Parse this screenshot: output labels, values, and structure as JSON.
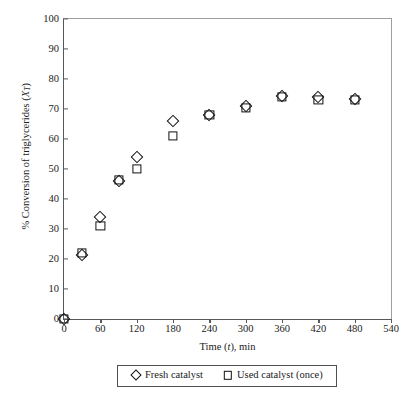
{
  "chart_data": {
    "type": "scatter",
    "title": "",
    "xlabel": "Time (t), min",
    "ylabel": "% Conversion of triglycerides (XT)",
    "xlim": [
      0,
      540
    ],
    "ylim": [
      0,
      100
    ],
    "xticks": [
      0,
      60,
      120,
      180,
      240,
      300,
      360,
      420,
      480,
      540
    ],
    "yticks": [
      0,
      10,
      20,
      30,
      40,
      50,
      60,
      70,
      80,
      90,
      100
    ],
    "grid": false,
    "legend_position": "bottom-center",
    "x": [
      0,
      30,
      60,
      90,
      120,
      180,
      240,
      300,
      360,
      420,
      480
    ],
    "series": [
      {
        "name": "Fresh catalyst",
        "marker": "open-diamond",
        "color": "#111111",
        "values": [
          0,
          21.3,
          34,
          46,
          54,
          66,
          68,
          71,
          74.5,
          74,
          73.5
        ]
      },
      {
        "name": "Used catalyst (once)",
        "marker": "open-square",
        "color": "#111111",
        "values": [
          0,
          22,
          31,
          46.3,
          50,
          61,
          68,
          70.5,
          74,
          73,
          73
        ]
      }
    ]
  },
  "axis_titles": {
    "x_prefix": "Time (",
    "x_italic": "t",
    "x_suffix": "), min",
    "y_prefix": "% Conversion of triglycerides (",
    "y_italic": "X",
    "y_sub": "T",
    "y_suffix": ")"
  },
  "legend": {
    "items": [
      {
        "label": "Fresh catalyst",
        "marker": "open-diamond"
      },
      {
        "label": "Used catalyst (once)",
        "marker": "open-square"
      }
    ]
  }
}
